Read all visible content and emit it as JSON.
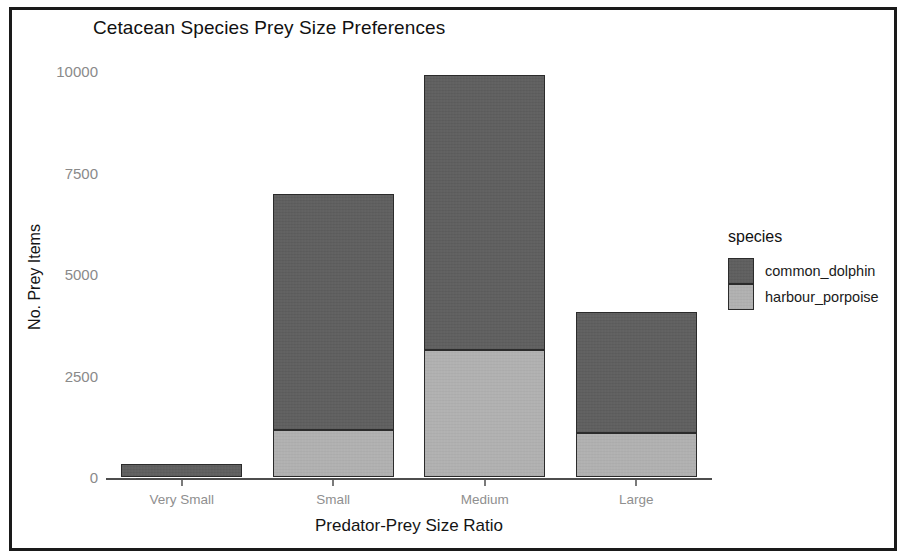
{
  "chart_data": {
    "type": "bar",
    "title": "Cetacean Species Prey Size Preferences",
    "subtitle": "",
    "xlabel": "Predator-Prey Size Ratio",
    "ylabel": "No. Prey Items",
    "stacked": true,
    "grid": false,
    "legend_position": "right",
    "legend_title": "species",
    "categories": [
      "Very Small",
      "Small",
      "Medium",
      "Large"
    ],
    "ylim": [
      0,
      10600
    ],
    "yticks": [
      0,
      2500,
      5000,
      7500,
      10000
    ],
    "ytick_labels": [
      "0",
      "2500",
      "5000",
      "7500",
      "10000"
    ],
    "series": [
      {
        "name": "common_dolphin",
        "color": "#5e5e5e",
        "values": [
          320,
          5810,
          6770,
          2980
        ]
      },
      {
        "name": "harbour_porpoise",
        "color": "#b1b1b1",
        "values": [
          0,
          1160,
          3130,
          1080
        ]
      }
    ],
    "totals": [
      320,
      6970,
      9900,
      4060
    ]
  },
  "figure": {
    "border_color": "#1a1a1a",
    "background": "#ffffff",
    "axis_color": "#4d4d4d",
    "tick_label_color": "#8a8a8a"
  }
}
